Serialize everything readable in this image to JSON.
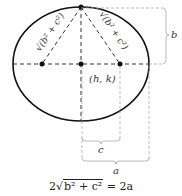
{
  "diagram": {
    "type": "ellipse-foci",
    "center_label": "(h, k)",
    "slant_label_left": "√(b² + c²)",
    "slant_label_right": "√(b² + c²)",
    "bracket_labels": {
      "b": "b",
      "c": "c",
      "a": "a"
    },
    "equation": {
      "coef": "2",
      "radicand": "b² + c²",
      "rhs": "= 2a"
    },
    "colors": {
      "ellipse": "#111111",
      "dash": "#333333",
      "bracket": "#aaaaaa"
    }
  }
}
